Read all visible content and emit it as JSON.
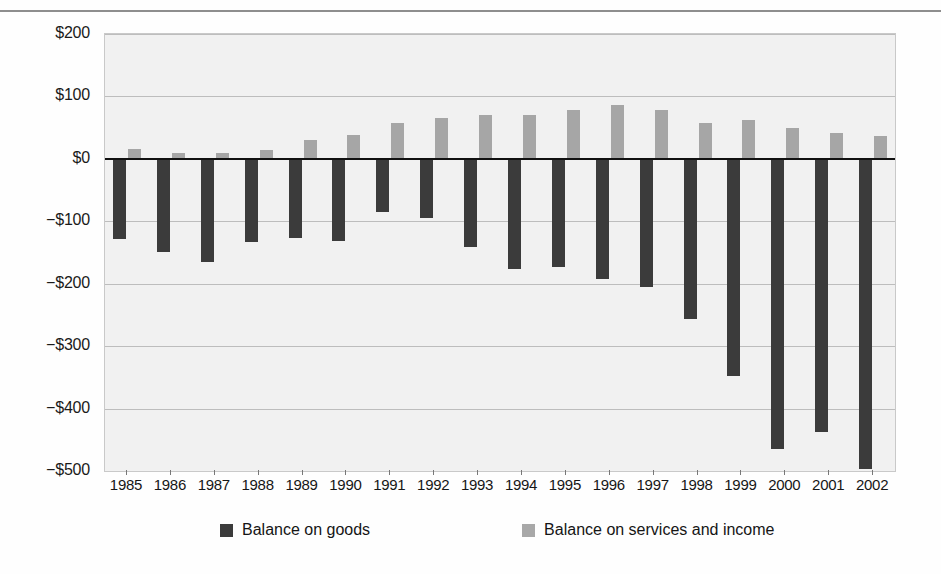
{
  "chart_data": {
    "type": "bar",
    "title": "",
    "xlabel": "",
    "ylabel": "",
    "ylim": [
      -500,
      200
    ],
    "grid": true,
    "legend_position": "bottom",
    "categories": [
      "1985",
      "1986",
      "1987",
      "1988",
      "1989",
      "1990",
      "1991",
      "1992",
      "1993",
      "1994",
      "1995",
      "1996",
      "1997",
      "1998",
      "1999",
      "2000",
      "2001",
      "2002"
    ],
    "ytick_labels": [
      "$200",
      "$100",
      "$0",
      "−$100",
      "−$200",
      "−$300",
      "−$400",
      "−$500"
    ],
    "ytick_values": [
      200,
      100,
      0,
      -100,
      -200,
      -300,
      -400,
      -500
    ],
    "series": [
      {
        "name": "Balance on goods",
        "color": "#3b3b3b",
        "values": [
          -128,
          -150,
          -166,
          -134,
          -126,
          -132,
          -85,
          -95,
          -141,
          -177,
          -174,
          -192,
          -205,
          -256,
          -348,
          -465,
          -437,
          -497
        ]
      },
      {
        "name": "Balance on services and income",
        "color": "#a6a6a6",
        "values": [
          16,
          9,
          9,
          14,
          31,
          38,
          58,
          66,
          71,
          70,
          78,
          87,
          78,
          57,
          62,
          50,
          41,
          37
        ]
      }
    ]
  },
  "legend": {
    "items": [
      {
        "label": "Balance on goods",
        "swatch": "dark"
      },
      {
        "label": "Balance on services and income",
        "swatch": "light"
      }
    ]
  }
}
